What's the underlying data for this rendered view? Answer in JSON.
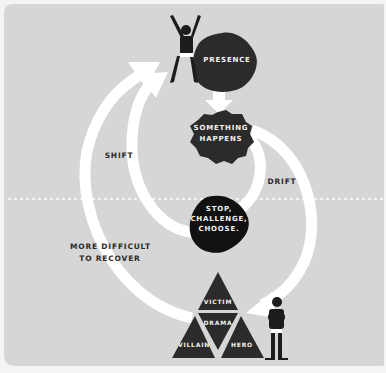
{
  "diagram": {
    "nodes": {
      "presence": "PRESENCE",
      "something_happens_1": "SOMETHING",
      "something_happens_2": "HAPPENS",
      "stop_1": "STOP,",
      "stop_2": "CHALLENGE,",
      "stop_3": "CHOOSE."
    },
    "triangle": {
      "top": "VICTIM",
      "center": "DRAMA",
      "left": "VILLAIN",
      "right": "HERO"
    },
    "arrow_labels": {
      "shift": "SHIFT",
      "drift": "DRIFT",
      "recover_1": "MORE DIFFICULT",
      "recover_2": "TO RECOVER"
    },
    "colors": {
      "background": "#d6d6d6",
      "node": "#2b2b2b",
      "arrow": "#ffffff",
      "text_dark": "#2a2a2a",
      "text_light": "#f2f2f2"
    }
  }
}
